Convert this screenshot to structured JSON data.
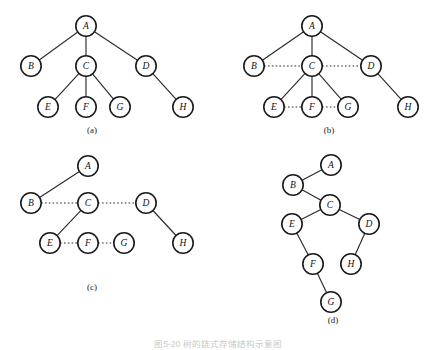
{
  "figure": {
    "caption": "图5-20  树的链式存储结构示意图",
    "background_color": "#ffffff",
    "node_stroke_color": "#1a1a1a",
    "node_fill_color": "#ffffff",
    "edge_color": "#2a2a2a",
    "node_radius": 10.2
  },
  "panels": [
    {
      "id": "panel-a",
      "label": "(a)",
      "label_pos": {
        "x": 92,
        "y": 133
      },
      "description": "General tree with parent-child solid edges only",
      "nodes": [
        {
          "id": "A",
          "label": "A",
          "x": 86,
          "y": 26
        },
        {
          "id": "B",
          "label": "B",
          "x": 31,
          "y": 66
        },
        {
          "id": "C",
          "label": "C",
          "x": 86,
          "y": 66
        },
        {
          "id": "D",
          "label": "D",
          "x": 146,
          "y": 66
        },
        {
          "id": "E",
          "label": "E",
          "x": 48,
          "y": 107
        },
        {
          "id": "F",
          "label": "F",
          "x": 86,
          "y": 107
        },
        {
          "id": "G",
          "label": "G",
          "x": 120,
          "y": 107
        },
        {
          "id": "H",
          "label": "H",
          "x": 183,
          "y": 107
        }
      ],
      "solid_edges": [
        [
          "A",
          "B"
        ],
        [
          "A",
          "C"
        ],
        [
          "A",
          "D"
        ],
        [
          "C",
          "E"
        ],
        [
          "C",
          "F"
        ],
        [
          "C",
          "G"
        ],
        [
          "D",
          "H"
        ]
      ],
      "dotted_edges": []
    },
    {
      "id": "panel-b",
      "label": "(b)",
      "label_pos": {
        "x": 329,
        "y": 133
      },
      "description": "Tree with child links plus dotted sibling links",
      "nodes": [
        {
          "id": "A",
          "label": "A",
          "x": 312,
          "y": 26
        },
        {
          "id": "B",
          "label": "B",
          "x": 254,
          "y": 66
        },
        {
          "id": "C",
          "label": "C",
          "x": 312,
          "y": 66
        },
        {
          "id": "D",
          "label": "D",
          "x": 371,
          "y": 66
        },
        {
          "id": "E",
          "label": "E",
          "x": 274,
          "y": 107
        },
        {
          "id": "F",
          "label": "F",
          "x": 312,
          "y": 107
        },
        {
          "id": "G",
          "label": "G",
          "x": 348,
          "y": 107
        },
        {
          "id": "H",
          "label": "H",
          "x": 408,
          "y": 107
        }
      ],
      "solid_edges": [
        [
          "A",
          "B"
        ],
        [
          "A",
          "C"
        ],
        [
          "A",
          "D"
        ],
        [
          "C",
          "E"
        ],
        [
          "C",
          "F"
        ],
        [
          "C",
          "G"
        ],
        [
          "D",
          "H"
        ]
      ],
      "dotted_edges": [
        [
          "B",
          "C"
        ],
        [
          "C",
          "D"
        ],
        [
          "E",
          "F"
        ],
        [
          "F",
          "G"
        ]
      ]
    },
    {
      "id": "panel-c",
      "label": "(c)",
      "label_pos": {
        "x": 92,
        "y": 290
      },
      "description": "First-child / next-sibling form: only first-child solid edges kept",
      "nodes": [
        {
          "id": "A",
          "label": "A",
          "x": 88,
          "y": 166
        },
        {
          "id": "B",
          "label": "B",
          "x": 31,
          "y": 203
        },
        {
          "id": "C",
          "label": "C",
          "x": 88,
          "y": 203
        },
        {
          "id": "D",
          "label": "D",
          "x": 146,
          "y": 203
        },
        {
          "id": "E",
          "label": "E",
          "x": 50,
          "y": 243
        },
        {
          "id": "F",
          "label": "F",
          "x": 88,
          "y": 243
        },
        {
          "id": "G",
          "label": "G",
          "x": 124,
          "y": 243
        },
        {
          "id": "H",
          "label": "H",
          "x": 183,
          "y": 243
        }
      ],
      "solid_edges": [
        [
          "A",
          "B"
        ],
        [
          "C",
          "E"
        ],
        [
          "D",
          "H"
        ]
      ],
      "dotted_edges": [
        [
          "B",
          "C"
        ],
        [
          "C",
          "D"
        ],
        [
          "E",
          "F"
        ],
        [
          "F",
          "G"
        ]
      ]
    },
    {
      "id": "panel-d",
      "label": "(d)",
      "label_pos": {
        "x": 333,
        "y": 323
      },
      "description": "Equivalent binary tree after rotation",
      "nodes": [
        {
          "id": "A",
          "label": "A",
          "x": 331,
          "y": 165
        },
        {
          "id": "B",
          "label": "B",
          "x": 293,
          "y": 185
        },
        {
          "id": "C",
          "label": "C",
          "x": 330,
          "y": 205
        },
        {
          "id": "E",
          "label": "E",
          "x": 292,
          "y": 224
        },
        {
          "id": "D",
          "label": "D",
          "x": 369,
          "y": 224
        },
        {
          "id": "F",
          "label": "F",
          "x": 313,
          "y": 264
        },
        {
          "id": "H",
          "label": "H",
          "x": 351,
          "y": 264
        },
        {
          "id": "G",
          "label": "G",
          "x": 331,
          "y": 302
        }
      ],
      "solid_edges": [
        [
          "A",
          "B"
        ],
        [
          "B",
          "C"
        ],
        [
          "C",
          "E"
        ],
        [
          "C",
          "D"
        ],
        [
          "E",
          "F"
        ],
        [
          "D",
          "H"
        ],
        [
          "F",
          "G"
        ]
      ],
      "dotted_edges": []
    }
  ]
}
